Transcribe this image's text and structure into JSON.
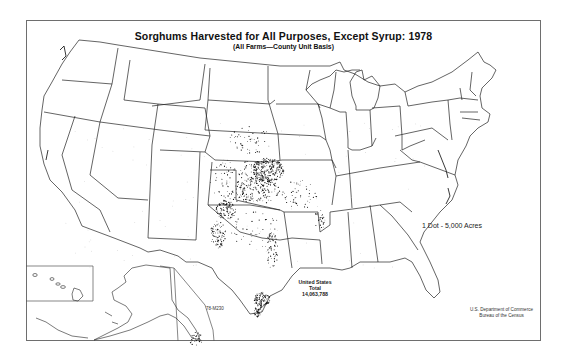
{
  "map": {
    "title": "Sorghums Harvested for All Purposes, Except Syrup:  1978",
    "subtitle": "(All Farms—County Unit Basis)",
    "legend": "1 Dot - 5,000 Acres",
    "total": {
      "line1": "United States",
      "line2": "Total",
      "line3": "14,063,788"
    },
    "map_code": "78-M230",
    "credit": {
      "line1": "U.S. Department of Commerce",
      "line2": "Bureau of the Census"
    },
    "insets": [
      "Alaska",
      "Hawaii"
    ],
    "dot_density_regions": [
      {
        "region": "Kansas / Nebraska border",
        "density": "very high"
      },
      {
        "region": "Western Kansas / Oklahoma panhandle",
        "density": "high"
      },
      {
        "region": "Texas High Plains",
        "density": "high"
      },
      {
        "region": "Central Texas (Blackland)",
        "density": "medium"
      },
      {
        "region": "Texas Gulf Coast / Coastal Bend",
        "density": "very high"
      },
      {
        "region": "Missouri / Illinois bootheel",
        "density": "low"
      },
      {
        "region": "South Dakota / Oklahoma / Missouri",
        "density": "low"
      },
      {
        "region": "California / Arizona / Southeast",
        "density": "sparse"
      }
    ],
    "colors": {
      "background": "#ffffff",
      "lines": "#222222",
      "dots": "#111111",
      "frame": "#6e6e6e"
    }
  }
}
